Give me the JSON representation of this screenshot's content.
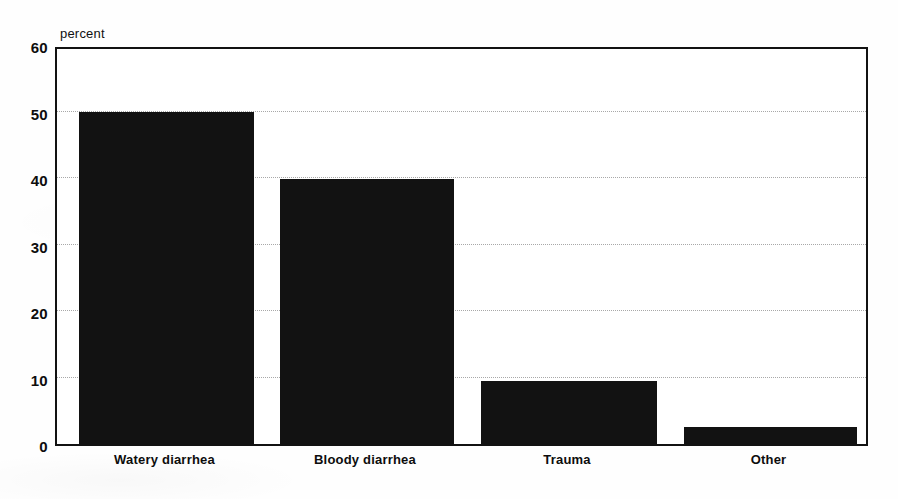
{
  "chart_data": {
    "type": "bar",
    "title": "",
    "subtitle": "",
    "xlabel": "",
    "ylabel": "percent",
    "ylim": [
      0,
      60
    ],
    "yticks": [
      0,
      10,
      20,
      30,
      40,
      50,
      60
    ],
    "ytick_labels": [
      "0",
      "10",
      "20",
      "30",
      "40",
      "50",
      "60"
    ],
    "grid": true,
    "grid_style": "dotted",
    "grid_axis": "y",
    "legend": false,
    "legend_position": "none",
    "categories": [
      "Watery diarrhea",
      "Bloody diarrhea",
      "Trauma",
      "Other"
    ],
    "values": [
      50,
      39.8,
      9.5,
      2.5
    ],
    "bar_color": "#121212",
    "background_color": "#ffffff",
    "frame_color": "#121212"
  },
  "axis": {
    "unit_label": "percent"
  },
  "colors": {
    "bar": "#121212",
    "grid": "#9a9a9a",
    "frame": "#121212",
    "text": "#0d0d0d",
    "background": "#ffffff"
  }
}
